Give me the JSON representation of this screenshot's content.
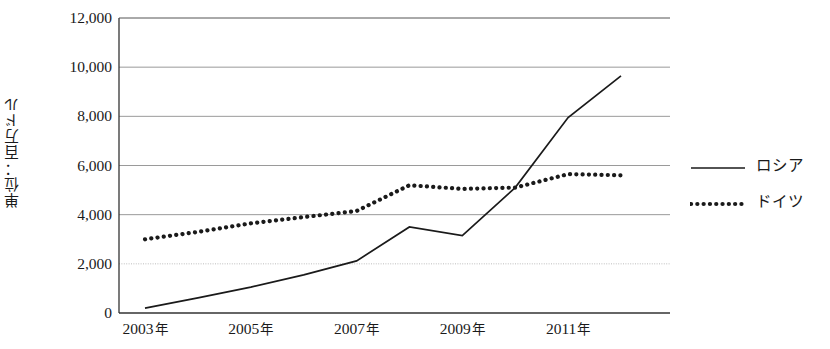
{
  "chart_data": {
    "type": "line",
    "title": "",
    "xlabel": "",
    "ylabel": "単位：百万ドル",
    "x": [
      2003,
      2004,
      2005,
      2006,
      2007,
      2008,
      2009,
      2010,
      2011,
      2012
    ],
    "x_tick_labels": [
      "2003 年",
      "2005 年",
      "2007 年",
      "2009 年",
      "2011 年"
    ],
    "x_tick_values": [
      2003,
      2005,
      2007,
      2009,
      2011
    ],
    "y_tick_labels": [
      "12,000",
      "10,000",
      "8,000",
      "6,000",
      "4,000",
      "2,000",
      "0"
    ],
    "y_tick_values": [
      12000,
      10000,
      8000,
      6000,
      4000,
      2000,
      0
    ],
    "ylim": [
      0,
      12000
    ],
    "xlim": [
      2003,
      2012
    ],
    "grid": "horizontal",
    "legend_position": "right",
    "series": [
      {
        "name": "ロシア",
        "style": "solid",
        "color": "#1a1a1a",
        "values": [
          200,
          620,
          1050,
          1550,
          2120,
          3500,
          3150,
          5100,
          7950,
          9650
        ]
      },
      {
        "name": "ドイツ",
        "style": "dotted",
        "color": "#1a1a1a",
        "values": [
          3000,
          3300,
          3650,
          3900,
          4150,
          5200,
          5050,
          5100,
          5650,
          5600
        ]
      }
    ]
  },
  "axis": {
    "y_title": "単位：百万ドル"
  },
  "legend": {
    "items": [
      {
        "label": "ロシア",
        "style": "solid"
      },
      {
        "label": "ドイツ",
        "style": "dotted"
      }
    ]
  }
}
